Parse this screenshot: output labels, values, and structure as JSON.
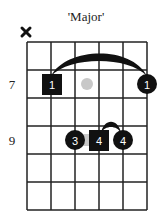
{
  "title": "'Major'",
  "muted_string_symbol": "×",
  "fret_labels": [
    {
      "label": "7",
      "row": 1
    },
    {
      "label": "9",
      "row": 3
    }
  ],
  "grid": {
    "strings": 6,
    "frets": 6
  },
  "markers": [
    {
      "shape": "square",
      "finger": "1",
      "string": 2,
      "row": 1
    },
    {
      "shape": "ghost-dot",
      "finger": "",
      "string": 3.5,
      "row": 1
    },
    {
      "shape": "circle",
      "finger": "1",
      "string": 6,
      "row": 1
    },
    {
      "shape": "circle",
      "finger": "3",
      "string": 3,
      "row": 3
    },
    {
      "shape": "square",
      "finger": "4",
      "string": 4,
      "row": 3
    },
    {
      "shape": "circle",
      "finger": "4",
      "string": 5,
      "row": 3
    }
  ],
  "barres": [
    {
      "from_string": 2,
      "to_string": 6,
      "row": 1
    },
    {
      "from_string": 4,
      "to_string": 5,
      "row": 3
    }
  ],
  "colors": {
    "ink": "#111111",
    "ghost": "#c8c8c8",
    "grid": "#222222"
  }
}
